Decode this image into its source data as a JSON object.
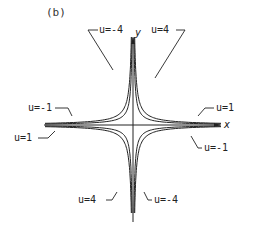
{
  "figure": {
    "panel_label": "(b)",
    "axes": {
      "x_label": "x",
      "y_label": "y"
    },
    "curves": [
      {
        "id": "u_neg4",
        "label": "u=-4",
        "label_text": "u=-4",
        "description": "inner curve, quadrants II and IV"
      },
      {
        "id": "u_pos4",
        "label": "u=4",
        "label_text": "u=4",
        "description": "inner curve, quadrants I and III"
      },
      {
        "id": "u_neg1",
        "label": "u=-1",
        "label_text": "u=-1",
        "description": "outer curve, quadrants II and IV"
      },
      {
        "id": "u_pos1",
        "label": "u=1",
        "label_text": "u=1",
        "description": "outer curve, quadrants I and III"
      }
    ],
    "labels": {
      "top_left": "u=-4",
      "top_right": "u=4",
      "mid_left_upper": "u=-1",
      "mid_right_upper": "u=1",
      "mid_left_lower": "u=1",
      "mid_right_lower": "u=-1",
      "bottom_left": "u=4",
      "bottom_right": "u=-4"
    }
  }
}
